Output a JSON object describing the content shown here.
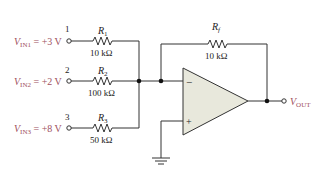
{
  "diagram": {
    "type": "summing-amplifier",
    "inputs": [
      {
        "node": "1",
        "name": "V",
        "sub": "IN1",
        "value": "= +3 V",
        "resistor": "R",
        "rsub": "1",
        "rvalue": "10 kΩ"
      },
      {
        "node": "2",
        "name": "V",
        "sub": "IN2",
        "value": "= +2 V",
        "resistor": "R",
        "rsub": "2",
        "rvalue": "100 kΩ"
      },
      {
        "node": "3",
        "name": "V",
        "sub": "IN3",
        "value": "= +8 V",
        "resistor": "R",
        "rsub": "3",
        "rvalue": "50 kΩ"
      }
    ],
    "feedback": {
      "resistor": "R",
      "rsub": "f",
      "rvalue": "10 kΩ"
    },
    "opamp": {
      "inverting": "−",
      "noninverting": "+"
    },
    "output": {
      "name": "V",
      "sub": "OUT"
    },
    "colors": {
      "label": "#a0505e",
      "opamp_fill": "#e8e8dc",
      "wire": "#333333"
    }
  }
}
